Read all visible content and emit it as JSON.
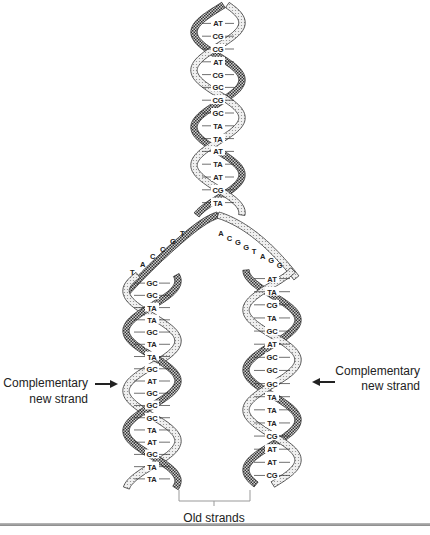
{
  "diagram": {
    "parent_helix_pairs": [
      "AT",
      "CG",
      "CG",
      "AT",
      "CG",
      "GC",
      "CG",
      "GC",
      "TA",
      "TA",
      "AT",
      "TA",
      "AT",
      "CG",
      "TA"
    ],
    "fork_left_bases": [
      "T",
      "G",
      "C",
      "C",
      "A",
      "T"
    ],
    "fork_right_bases": [
      "A",
      "C",
      "G",
      "G",
      "T",
      "A",
      "G",
      "G"
    ],
    "left_daughter_pairs": [
      "GC",
      "GC",
      "TA",
      "TA",
      "GC",
      "TA",
      "TA",
      "GC",
      "AT",
      "GC",
      "GC",
      "GC",
      "TA",
      "AT",
      "GC",
      "TA",
      "TA"
    ],
    "right_daughter_pairs": [
      "AT",
      "TA",
      "CG",
      "TA",
      "GC",
      "AT",
      "GC",
      "GC",
      "GC",
      "TA",
      "TA",
      "TA",
      "CG",
      "AT",
      "AT",
      "CG"
    ],
    "labels": {
      "left_callout_line1": "Complementary",
      "left_callout_line2": "new strand",
      "right_callout_line1": "Complementary",
      "right_callout_line2": "new strand",
      "old_strands": "Old strands"
    },
    "colors": {
      "ink": "#222222",
      "old_strand_fill": "#d8d8d8",
      "new_strand_fill": "#9a9a9a"
    }
  }
}
